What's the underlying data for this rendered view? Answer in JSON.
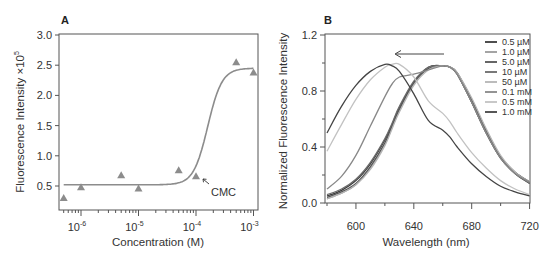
{
  "chart_data": [
    {
      "panel": "A",
      "type": "scatter",
      "title": "",
      "xlabel": "Concentration (M)",
      "ylabel": "Fluorescence Intensity ×10^5",
      "xscale": "log",
      "xlim": [
        4e-07,
        0.0011
      ],
      "ylim": [
        0.25,
        3.0
      ],
      "xticks": [
        {
          "value": 1e-06,
          "base": "10",
          "exp": "-6"
        },
        {
          "value": 1e-05,
          "base": "10",
          "exp": "-5"
        },
        {
          "value": 0.0001,
          "base": "10",
          "exp": "-4"
        },
        {
          "value": 0.001,
          "base": "10",
          "exp": "-3"
        }
      ],
      "yticks": [
        "0.5",
        "1.0",
        "1.5",
        "2.0",
        "2.5",
        "3.0"
      ],
      "ylabel_main": "Fluorescence Intensity ×10",
      "ylabel_exp": "5",
      "series": [
        {
          "name": "measured",
          "marker": "triangle",
          "color": "#8c8c8c",
          "x": [
            5e-07,
            1e-06,
            5e-06,
            1e-05,
            5e-05,
            0.0001,
            0.0005,
            0.001
          ],
          "y": [
            0.3,
            0.48,
            0.68,
            0.46,
            0.76,
            0.66,
            2.55,
            2.38
          ]
        },
        {
          "name": "sigmoid fit",
          "type": "line",
          "color": "#8c8c8c",
          "bottom": 0.52,
          "top": 2.45,
          "x50": 0.00016,
          "hill": 3.5
        }
      ],
      "annotations": [
        {
          "text": "CMC",
          "x": 0.00011,
          "y": 0.5,
          "arrow": true
        }
      ],
      "grid": false
    },
    {
      "panel": "B",
      "type": "line",
      "title": "",
      "xlabel": "Wavelength (nm)",
      "ylabel": "Normalized Fluorescence Intensity",
      "xlim": [
        580,
        720
      ],
      "ylim": [
        0.0,
        1.2
      ],
      "xticks": [
        "600",
        "640",
        "680",
        "720"
      ],
      "yticks": [
        "0.0",
        "0.4",
        "0.8",
        "1.2"
      ],
      "legend_position": "upper right",
      "grid": false,
      "annotations": [
        {
          "type": "arrow",
          "from_x": 660,
          "to_x": 628,
          "y": 1.0,
          "direction": "left"
        }
      ],
      "x": [
        580,
        590,
        600,
        610,
        620,
        625,
        630,
        640,
        650,
        660,
        665,
        670,
        680,
        690,
        700,
        710,
        720
      ],
      "series": [
        {
          "name": "0.5 µM",
          "color": "#3a3a3a",
          "values": [
            0.05,
            0.09,
            0.16,
            0.28,
            0.45,
            0.56,
            0.68,
            0.86,
            0.97,
            0.98,
            0.97,
            0.92,
            0.72,
            0.5,
            0.32,
            0.21,
            0.14
          ]
        },
        {
          "name": "1.0 µM",
          "color": "#9a9a9a",
          "values": [
            0.03,
            0.07,
            0.13,
            0.25,
            0.42,
            0.54,
            0.66,
            0.85,
            0.96,
            0.98,
            0.97,
            0.93,
            0.73,
            0.51,
            0.33,
            0.22,
            0.15
          ]
        },
        {
          "name": "5.0 µM",
          "color": "#555555",
          "values": [
            0.04,
            0.08,
            0.14,
            0.26,
            0.43,
            0.55,
            0.67,
            0.86,
            0.96,
            0.98,
            0.97,
            0.93,
            0.74,
            0.52,
            0.33,
            0.22,
            0.15
          ]
        },
        {
          "name": "10 µM",
          "color": "#6a6a6a",
          "values": [
            0.06,
            0.1,
            0.17,
            0.29,
            0.46,
            0.57,
            0.69,
            0.87,
            0.97,
            0.98,
            0.97,
            0.92,
            0.72,
            0.5,
            0.32,
            0.21,
            0.14
          ]
        },
        {
          "name": "50 µM",
          "color": "#b5b5b5",
          "values": [
            0.03,
            0.07,
            0.13,
            0.24,
            0.41,
            0.53,
            0.65,
            0.84,
            0.95,
            0.98,
            0.97,
            0.93,
            0.75,
            0.53,
            0.34,
            0.22,
            0.15
          ]
        },
        {
          "name": "0.1 mM",
          "color": "#888888",
          "values": [
            0.1,
            0.19,
            0.34,
            0.55,
            0.76,
            0.85,
            0.9,
            0.92,
            0.95,
            0.98,
            0.97,
            0.92,
            0.72,
            0.5,
            0.32,
            0.21,
            0.15
          ]
        },
        {
          "name": "0.5 mM",
          "color": "#c2c2c2",
          "values": [
            0.37,
            0.56,
            0.74,
            0.88,
            0.97,
            0.99,
            0.99,
            0.9,
            0.73,
            0.64,
            0.58,
            0.5,
            0.36,
            0.25,
            0.16,
            0.1,
            0.06
          ]
        },
        {
          "name": "1.0 mM",
          "color": "#444444",
          "values": [
            0.5,
            0.69,
            0.84,
            0.94,
            0.99,
            0.98,
            0.94,
            0.78,
            0.59,
            0.52,
            0.47,
            0.4,
            0.28,
            0.19,
            0.12,
            0.08,
            0.05
          ]
        }
      ]
    }
  ],
  "panels": {
    "a": {
      "label": "A",
      "annotation": "CMC",
      "xlabel": "Concentration (M)"
    },
    "b": {
      "label": "B",
      "xlabel": "Wavelength (nm)",
      "ylabel": "Normalized Fluorescence Intensity"
    }
  }
}
